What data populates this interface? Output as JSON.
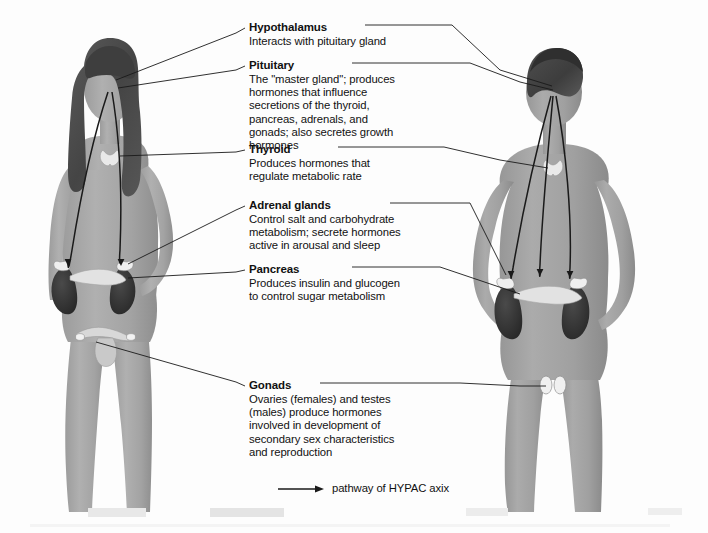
{
  "figure": {
    "background_color": "#fdfdfd",
    "skin_tone_color": "#a8a8a8",
    "hair_color": "#4a4a4a",
    "organ_dark_color": "#333333",
    "leader_line_color": "#111111",
    "female_figure_label": "female-body-front-view",
    "male_figure_label": "male-body-back-view"
  },
  "callouts": [
    {
      "id": "hypothalamus",
      "title": "Hypothalamus",
      "body": "Interacts with pituitary gland"
    },
    {
      "id": "pituitary",
      "title": "Pituitary",
      "body": "The \"master gland\"; produces\nhormones that influence\nsecretions of the thyroid,\npancreas, adrenals, and\ngonads; also secretes growth\nhormones"
    },
    {
      "id": "thyroid",
      "title": "Thyroid",
      "body": "Produces hormones that\nregulate metabolic rate"
    },
    {
      "id": "adrenal-glands",
      "title": "Adrenal glands",
      "body": "Control salt and carbohydrate\nmetabolism; secrete hormones\nactive in arousal and sleep"
    },
    {
      "id": "pancreas",
      "title": "Pancreas",
      "body": "Produces insulin and glucogen\nto control sugar metabolism"
    },
    {
      "id": "gonads",
      "title": "Gonads",
      "body": "Ovaries (females) and testes\n(males) produce hormones\ninvolved in development of\nsecondary sex characteristics\nand reproduction"
    }
  ],
  "legend": {
    "arrow_icon": "right-arrow-icon",
    "text": "pathway of HYPAC axix"
  }
}
